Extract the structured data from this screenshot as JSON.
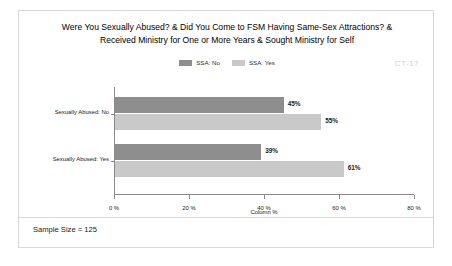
{
  "card": {
    "title_lines": [
      "Were You Sexually Abused? & Did You Come to FSM Having Same-Sex Attractions? &",
      "Received Ministry for One or More Years & Sought Ministry for Self"
    ],
    "watermark": "CT-17",
    "footer": "Sample Size = 125"
  },
  "colors": {
    "series_no": "#8e8e8e",
    "series_yes": "#c9c9c9",
    "axis": "#8a8a8a",
    "border": "#d8d8d8",
    "watermark": "#d2d2d2"
  },
  "chart_data": {
    "type": "bar",
    "orientation": "horizontal",
    "title": "Were You Sexually Abused? & Did You Come to FSM Having Same-Sex Attractions? & Received Ministry for One or More Years & Sought Ministry for Self",
    "categories": [
      "Sexually Abused: No",
      "Sexually Abused: Yes"
    ],
    "series": [
      {
        "name": "SSA: No",
        "values": [
          45,
          39
        ],
        "labels": [
          "45%",
          "39%"
        ],
        "color": "#8e8e8e"
      },
      {
        "name": "SSA: Yes",
        "values": [
          55,
          61
        ],
        "labels": [
          "55%",
          "61%"
        ],
        "color": "#c9c9c9"
      }
    ],
    "xlabel": "Column %",
    "ylabel": "",
    "xlim": [
      0,
      80
    ],
    "xticks": [
      0,
      20,
      40,
      60,
      80
    ],
    "xtick_labels": [
      "0 %",
      "20 %",
      "40 %",
      "60 %",
      "80 %"
    ],
    "grid": false,
    "legend_position": "top-center",
    "annotations": [
      "CT-17",
      "Sample Size = 125"
    ]
  }
}
